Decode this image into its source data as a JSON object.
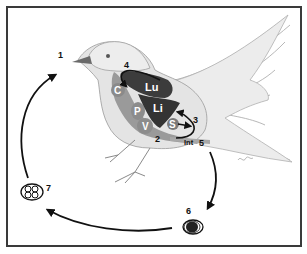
{
  "diagram": {
    "type": "life-cycle",
    "stage_labels": {
      "s1": "1",
      "s2": "2",
      "s3": "3",
      "s4": "4",
      "s5": "5",
      "s6": "6",
      "s7": "7"
    },
    "organ_labels": {
      "lungs": "Lu",
      "liver": "Li",
      "crop": "C",
      "proventriculus": "P",
      "ventriculus": "V",
      "spleen": "S",
      "intestine": "Int"
    },
    "colors": {
      "frame": "#3a3a3a",
      "bird_body": "#e6e6e6",
      "bird_outline": "#9a9a9a",
      "dark_organ": "#3c3c3c",
      "mid_organ": "#8c8c8c",
      "arrow": "#111111",
      "label_light": "#ffffff",
      "label_dark": "#111111"
    }
  }
}
